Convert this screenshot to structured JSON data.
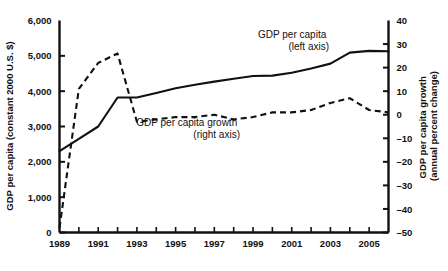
{
  "chart_data": {
    "type": "line",
    "title": "",
    "xlabel": "",
    "ylabel": "GDP per capita (constant 2000 U.S. $)",
    "y2label": "GDP per capita growth (annual percent change)",
    "grid": false,
    "legend_position": "inline-annotation",
    "x": [
      1989,
      1990,
      1991,
      1992,
      1993,
      1994,
      1995,
      1996,
      1997,
      1998,
      1999,
      2000,
      2001,
      2002,
      2003,
      2004,
      2005,
      2006
    ],
    "xlim": [
      1989,
      2006
    ],
    "ylim": [
      0,
      6000
    ],
    "y2lim": [
      -50,
      40
    ],
    "x_ticks": [
      1989,
      1990,
      1991,
      1992,
      1993,
      1994,
      1995,
      1996,
      1997,
      1998,
      1999,
      2000,
      2001,
      2002,
      2003,
      2004,
      2005,
      2006
    ],
    "x_tick_labels": [
      "1989",
      "",
      "1991",
      "",
      "1993",
      "",
      "1995",
      "",
      "1997",
      "",
      "1999",
      "",
      "2001",
      "",
      "2003",
      "",
      "2005",
      ""
    ],
    "y_ticks": [
      0,
      1000,
      2000,
      3000,
      4000,
      5000,
      6000
    ],
    "y_tick_labels": [
      "0",
      "1,000",
      "2,000",
      "3,000",
      "4,000",
      "5,000",
      "6,000"
    ],
    "y2_ticks": [
      -50,
      -40,
      -30,
      -20,
      -10,
      0,
      10,
      20,
      30,
      40
    ],
    "y2_tick_labels": [
      "–50",
      "–40",
      "–30",
      "–20",
      "–10",
      "0",
      "10",
      "20",
      "30",
      "40"
    ],
    "series": [
      {
        "name": "GDP per capita (left axis)",
        "axis": "left",
        "style": "solid",
        "color": "#111111",
        "values": [
          2300,
          2650,
          3000,
          3820,
          3820,
          3950,
          4080,
          4180,
          4270,
          4350,
          4430,
          4440,
          4520,
          4640,
          4780,
          5090,
          5140,
          5130
        ]
      },
      {
        "name": "GDP per capita growth (right axis)",
        "axis": "right",
        "style": "dashed",
        "color": "#111111",
        "values": [
          -48,
          11,
          22,
          26,
          -3,
          -2,
          -1,
          -1,
          0,
          -2,
          -1,
          1,
          1,
          2,
          5,
          7,
          2,
          1
        ]
      }
    ],
    "annotations": [
      {
        "name": "series-label-gdp-per-capita",
        "line1": "GDP per capita",
        "line2": "(left axis)"
      },
      {
        "name": "series-label-gdp-growth",
        "line1": "GDP per capita growth",
        "line2": "(right axis)"
      }
    ]
  }
}
